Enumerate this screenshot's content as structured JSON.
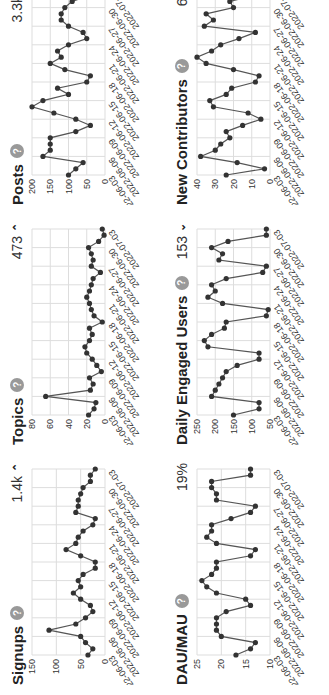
{
  "dates": [
    "2022-06-03",
    "2022-06-04",
    "2022-06-05",
    "2022-06-06",
    "2022-06-07",
    "2022-06-08",
    "2022-06-09",
    "2022-06-10",
    "2022-06-11",
    "2022-06-12",
    "2022-06-13",
    "2022-06-14",
    "2022-06-15",
    "2022-06-16",
    "2022-06-17",
    "2022-06-18",
    "2022-06-19",
    "2022-06-20",
    "2022-06-21",
    "2022-06-22",
    "2022-06-23",
    "2022-06-24",
    "2022-06-25",
    "2022-06-26",
    "2022-06-27",
    "2022-06-28",
    "2022-06-29",
    "2022-06-30",
    "2022-07-01",
    "2022-07-02",
    "2022-07-03"
  ],
  "x_tick_labels": [
    "2022-06-03",
    "2022-06-06",
    "2022-06-09",
    "2022-06-12",
    "2022-06-15",
    "2022-06-18",
    "2022-06-21",
    "2022-06-24",
    "2022-06-27",
    "2022-06-30",
    "2022-07-03"
  ],
  "colors": {
    "line": "#555555",
    "point": "#333333",
    "grid": "#dddddd",
    "help": "#999999"
  },
  "cards": [
    {
      "title": "Signups",
      "value": "1.4k",
      "trend": "up",
      "trend_icon": "chevron-up-icon"
    },
    {
      "title": "Topics",
      "value": "473",
      "trend": "up",
      "trend_icon": "chevron-up-icon"
    },
    {
      "title": "Posts",
      "value": "3.3k",
      "trend": "down",
      "trend_icon": "chevron-down-icon"
    },
    {
      "title": "DAU/MAU",
      "value": "19%",
      "trend": "",
      "trend_icon": ""
    },
    {
      "title": "Daily Engaged Users",
      "value": "153",
      "trend": "down",
      "trend_icon": "chevron-down-icon"
    },
    {
      "title": "New Contributors",
      "value": "677",
      "trend": "",
      "trend_icon": ""
    }
  ],
  "chart_data": [
    {
      "type": "line",
      "title": "Signups",
      "xlabel": "",
      "ylabel": "",
      "ylim": [
        0,
        150
      ],
      "yticks": [
        0,
        50,
        100,
        150
      ],
      "grid": true,
      "values": [
        35,
        25,
        40,
        50,
        115,
        60,
        40,
        25,
        30,
        50,
        65,
        50,
        55,
        45,
        20,
        20,
        50,
        80,
        60,
        55,
        45,
        25,
        20,
        60,
        55,
        55,
        50,
        45,
        30,
        30,
        20
      ]
    },
    {
      "type": "line",
      "title": "Topics",
      "xlabel": "",
      "ylabel": "",
      "ylim": [
        0,
        80
      ],
      "yticks": [
        0,
        20,
        40,
        60,
        80
      ],
      "grid": true,
      "values": [
        18,
        12,
        10,
        65,
        16,
        13,
        17,
        4,
        9,
        14,
        20,
        22,
        17,
        14,
        17,
        3,
        12,
        15,
        17,
        20,
        17,
        15,
        13,
        5,
        15,
        13,
        15,
        18,
        7,
        1,
        3
      ]
    },
    {
      "type": "line",
      "title": "Posts",
      "xlabel": "",
      "ylabel": "",
      "ylim": [
        0,
        200
      ],
      "yticks": [
        0,
        50,
        100,
        150,
        200
      ],
      "grid": true,
      "values": [
        100,
        80,
        60,
        170,
        150,
        150,
        150,
        80,
        40,
        80,
        140,
        200,
        170,
        100,
        130,
        50,
        40,
        110,
        150,
        120,
        130,
        100,
        50,
        60,
        100,
        120,
        120,
        110,
        90,
        40,
        40
      ]
    },
    {
      "type": "line",
      "title": "DAU/MAU",
      "xlabel": "",
      "ylabel": "",
      "ylim": [
        10,
        25
      ],
      "yticks": [
        10,
        15,
        20,
        25
      ],
      "grid": true,
      "values": [
        17,
        14,
        13,
        20,
        21,
        21,
        21,
        19,
        14,
        15,
        21,
        23,
        24,
        22,
        21,
        21,
        14,
        13,
        21,
        23,
        22,
        22,
        18,
        14,
        13,
        21,
        21,
        22,
        22,
        14,
        14
      ]
    },
    {
      "type": "line",
      "title": "Daily Engaged Users",
      "xlabel": "",
      "ylabel": "",
      "ylim": [
        50,
        250
      ],
      "yticks": [
        50,
        100,
        150,
        200,
        250
      ],
      "grid": true,
      "values": [
        150,
        80,
        80,
        210,
        200,
        190,
        180,
        170,
        140,
        80,
        80,
        220,
        230,
        210,
        175,
        170,
        60,
        55,
        180,
        220,
        200,
        210,
        170,
        70,
        60,
        190,
        180,
        210,
        165,
        60,
        60
      ]
    },
    {
      "type": "line",
      "title": "New Contributors",
      "xlabel": "",
      "ylabel": "",
      "ylim": [
        0,
        40
      ],
      "yticks": [
        0,
        10,
        20,
        30,
        40
      ],
      "grid": true,
      "values": [
        24,
        3,
        18,
        38,
        30,
        27,
        22,
        24,
        15,
        5,
        12,
        31,
        33,
        24,
        21,
        8,
        6,
        20,
        35,
        40,
        32,
        27,
        17,
        8,
        36,
        31,
        35,
        20,
        22,
        8,
        13
      ]
    }
  ]
}
